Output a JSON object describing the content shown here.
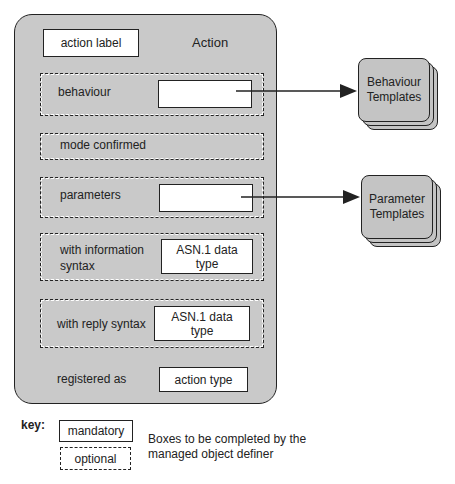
{
  "diagram": {
    "title": "Action",
    "action_label": "action label",
    "rows": [
      {
        "label": "behaviour",
        "box": ""
      },
      {
        "label": "mode confirmed"
      },
      {
        "label": "parameters",
        "box": ""
      },
      {
        "label_line1": "with information",
        "label_line2": "syntax",
        "box_line1": "ASN.1 data",
        "box_line2": "type"
      },
      {
        "label": "with reply syntax",
        "box_line1": "ASN.1 data",
        "box_line2": "type"
      },
      {
        "label": "registered as",
        "box": "action type"
      }
    ],
    "templates": [
      {
        "line1": "Behaviour",
        "line2": "Templates"
      },
      {
        "line1": "Parameter",
        "line2": "Templates"
      }
    ]
  },
  "key": {
    "label": "key:",
    "mandatory": "mandatory",
    "optional": "optional",
    "description_line1": "Boxes to be completed by the",
    "description_line2": "managed object definer"
  },
  "colors": {
    "fill_gray": "#c9c9c9",
    "border": "#222222",
    "box_fill": "#ffffff"
  }
}
